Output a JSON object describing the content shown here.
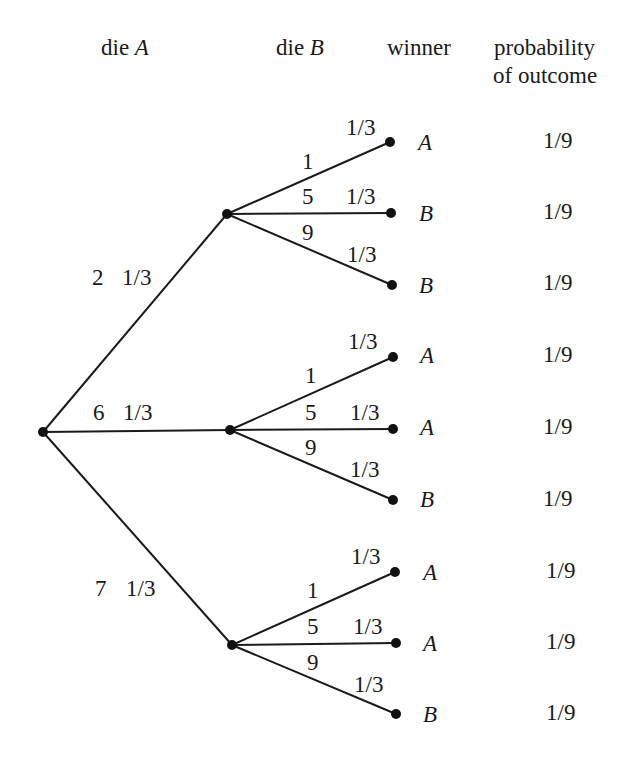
{
  "headers": {
    "die_a_prefix": "die ",
    "die_a_var": "A",
    "die_b_prefix": "die ",
    "die_b_var": "B",
    "winner": "winner",
    "probability_line1": "probability",
    "probability_line2": "of outcome"
  },
  "tree": {
    "root": {
      "x": 43,
      "y": 432
    },
    "first_branches": [
      {
        "value": "2",
        "prob": "1/3",
        "node": {
          "x": 227,
          "y": 214
        },
        "label_pos": {
          "value_x": 92,
          "prob_x": 122,
          "y": 285
        },
        "children": [
          {
            "value": "1",
            "prob": "1/3",
            "winner": "A",
            "outcome_prob": "1/9",
            "leaf": {
              "x": 390,
              "y": 142
            }
          },
          {
            "value": "5",
            "prob": "1/3",
            "winner": "B",
            "outcome_prob": "1/9",
            "leaf": {
              "x": 391,
              "y": 213
            }
          },
          {
            "value": "9",
            "prob": "1/3",
            "winner": "B",
            "outcome_prob": "1/9",
            "leaf": {
              "x": 392,
              "y": 285
            }
          }
        ]
      },
      {
        "value": "6",
        "prob": "1/3",
        "node": {
          "x": 230,
          "y": 430
        },
        "label_pos": {
          "value_x": 93,
          "prob_x": 123,
          "y": 420
        },
        "children": [
          {
            "value": "1",
            "prob": "1/3",
            "winner": "A",
            "outcome_prob": "1/9",
            "leaf": {
              "x": 393,
              "y": 357
            }
          },
          {
            "value": "5",
            "prob": "1/3",
            "winner": "A",
            "outcome_prob": "1/9",
            "leaf": {
              "x": 393,
              "y": 429
            }
          },
          {
            "value": "9",
            "prob": "1/3",
            "winner": "B",
            "outcome_prob": "1/9",
            "leaf": {
              "x": 393,
              "y": 500
            }
          }
        ]
      },
      {
        "value": "7",
        "prob": "1/3",
        "node": {
          "x": 232,
          "y": 645
        },
        "label_pos": {
          "value_x": 95,
          "prob_x": 126,
          "y": 596
        },
        "children": [
          {
            "value": "1",
            "prob": "1/3",
            "winner": "A",
            "outcome_prob": "1/9",
            "leaf": {
              "x": 395,
              "y": 572
            }
          },
          {
            "value": "5",
            "prob": "1/3",
            "winner": "A",
            "outcome_prob": "1/9",
            "leaf": {
              "x": 396,
              "y": 643
            }
          },
          {
            "value": "9",
            "prob": "1/3",
            "winner": "B",
            "outcome_prob": "1/9",
            "leaf": {
              "x": 396,
              "y": 714
            }
          }
        ]
      }
    ]
  },
  "colors": {
    "ink": "#1a1a1a",
    "background": "#ffffff"
  }
}
